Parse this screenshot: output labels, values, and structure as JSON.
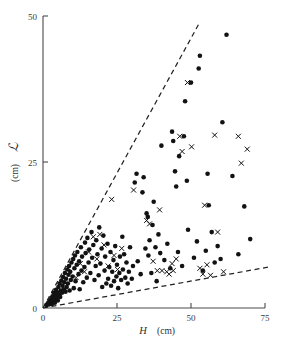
{
  "figure": {
    "background_color": "#ffffff",
    "marker_color": "#121212",
    "axis_color": "#4a4a4a"
  },
  "chart_data": {
    "type": "scatter",
    "title": "",
    "xlabel": "H  (cm)",
    "xlabel_symbol": "H",
    "xlabel_unit": "(cm)",
    "ylabel": "L  (cm)",
    "ylabel_symbol": "L",
    "ylabel_unit": "(cm)",
    "xlim": [
      0,
      75
    ],
    "ylim": [
      0,
      50
    ],
    "xticks": [
      0,
      25,
      50,
      75
    ],
    "xticklabels": [
      "0",
      "25",
      "50",
      "75"
    ],
    "yticks": [
      0,
      25,
      50
    ],
    "yticklabels": [
      "0",
      "25",
      "50"
    ],
    "grid": false,
    "legend": "none",
    "annotations": [
      {
        "name": "upper-dashed-guide",
        "type": "dashed-line",
        "x": [
          0,
          52.5
        ],
        "y": [
          0,
          48.5
        ]
      },
      {
        "name": "lower-dashed-guide",
        "type": "dashed-line",
        "x": [
          0,
          76
        ],
        "y": [
          0,
          7.0
        ]
      }
    ],
    "series": [
      {
        "name": "filled-circle",
        "marker": "o",
        "color": "#121212",
        "points": [
          [
            1.2,
            0.5
          ],
          [
            1.6,
            0.8
          ],
          [
            2.0,
            0.6
          ],
          [
            2.2,
            1.2
          ],
          [
            2.5,
            0.9
          ],
          [
            2.8,
            1.6
          ],
          [
            3.0,
            0.7
          ],
          [
            3.2,
            2.0
          ],
          [
            3.4,
            1.1
          ],
          [
            3.6,
            2.6
          ],
          [
            3.8,
            1.5
          ],
          [
            4.0,
            0.9
          ],
          [
            4.2,
            2.2
          ],
          [
            4.4,
            3.1
          ],
          [
            4.6,
            1.8
          ],
          [
            4.8,
            2.7
          ],
          [
            5.0,
            1.3
          ],
          [
            5.2,
            3.6
          ],
          [
            5.4,
            2.3
          ],
          [
            5.6,
            4.2
          ],
          [
            5.8,
            1.9
          ],
          [
            6.0,
            3.0
          ],
          [
            6.2,
            4.7
          ],
          [
            6.4,
            2.6
          ],
          [
            6.6,
            3.8
          ],
          [
            6.8,
            5.3
          ],
          [
            7.0,
            3.2
          ],
          [
            7.2,
            4.4
          ],
          [
            7.4,
            6.0
          ],
          [
            7.6,
            2.8
          ],
          [
            7.8,
            5.0
          ],
          [
            8.0,
            3.6
          ],
          [
            8.2,
            6.6
          ],
          [
            8.4,
            4.2
          ],
          [
            8.6,
            5.7
          ],
          [
            8.8,
            7.2
          ],
          [
            9.0,
            3.0
          ],
          [
            9.2,
            6.2
          ],
          [
            9.4,
            4.8
          ],
          [
            9.6,
            7.8
          ],
          [
            10.0,
            5.4
          ],
          [
            10.2,
            8.4
          ],
          [
            10.4,
            3.4
          ],
          [
            10.6,
            6.8
          ],
          [
            10.8,
            9.0
          ],
          [
            11.0,
            4.6
          ],
          [
            11.4,
            7.4
          ],
          [
            11.6,
            9.6
          ],
          [
            12.0,
            5.8
          ],
          [
            12.2,
            8.0
          ],
          [
            12.4,
            3.2
          ],
          [
            12.8,
            10.4
          ],
          [
            13.0,
            6.4
          ],
          [
            13.2,
            8.8
          ],
          [
            13.6,
            4.4
          ],
          [
            14.0,
            7.0
          ],
          [
            14.2,
            11.2
          ],
          [
            14.4,
            9.4
          ],
          [
            14.8,
            5.2
          ],
          [
            15.0,
            12.0
          ],
          [
            15.4,
            7.8
          ],
          [
            15.6,
            10.0
          ],
          [
            16.0,
            6.0
          ],
          [
            16.4,
            13.0
          ],
          [
            16.6,
            8.6
          ],
          [
            17.0,
            10.8
          ],
          [
            17.4,
            4.8
          ],
          [
            17.8,
            7.2
          ],
          [
            18.0,
            11.6
          ],
          [
            18.4,
            9.2
          ],
          [
            18.8,
            5.6
          ],
          [
            19.0,
            13.8
          ],
          [
            19.4,
            7.6
          ],
          [
            19.8,
            10.2
          ],
          [
            20.0,
            3.6
          ],
          [
            20.4,
            12.4
          ],
          [
            20.8,
            6.4
          ],
          [
            21.0,
            8.8
          ],
          [
            21.4,
            4.2
          ],
          [
            21.8,
            11.0
          ],
          [
            22.0,
            5.0
          ],
          [
            22.4,
            7.0
          ],
          [
            22.8,
            9.6
          ],
          [
            23.0,
            3.8
          ],
          [
            23.4,
            6.2
          ],
          [
            23.8,
            8.2
          ],
          [
            24.0,
            4.6
          ],
          [
            24.4,
            10.6
          ],
          [
            24.8,
            5.4
          ],
          [
            25.0,
            7.4
          ],
          [
            25.4,
            3.4
          ],
          [
            25.8,
            6.0
          ],
          [
            26.0,
            8.8
          ],
          [
            26.4,
            4.8
          ],
          [
            26.8,
            12.2
          ],
          [
            27.0,
            6.6
          ],
          [
            27.4,
            9.2
          ],
          [
            27.8,
            5.2
          ],
          [
            28.2,
            7.8
          ],
          [
            28.6,
            4.2
          ],
          [
            29.0,
            6.2
          ],
          [
            29.4,
            10.4
          ],
          [
            30.0,
            5.0
          ],
          [
            30.4,
            7.2
          ],
          [
            31.0,
            21.5
          ],
          [
            31.6,
            23.0
          ],
          [
            32.0,
            8.0
          ],
          [
            33.0,
            5.8
          ],
          [
            33.6,
            19.8
          ],
          [
            34.0,
            22.4
          ],
          [
            34.6,
            10.2
          ],
          [
            35.0,
            16.2
          ],
          [
            35.4,
            15.6
          ],
          [
            35.6,
            9.0
          ],
          [
            36.0,
            11.6
          ],
          [
            36.6,
            6.0
          ],
          [
            37.0,
            14.2
          ],
          [
            37.4,
            18.2
          ],
          [
            38.0,
            10.4
          ],
          [
            38.4,
            4.6
          ],
          [
            39.0,
            12.6
          ],
          [
            39.6,
            9.4
          ],
          [
            40.0,
            27.8
          ],
          [
            41.0,
            8.2
          ],
          [
            42.0,
            11.0
          ],
          [
            43.0,
            6.8
          ],
          [
            43.6,
            30.2
          ],
          [
            44.0,
            28.6
          ],
          [
            44.6,
            23.4
          ],
          [
            45.0,
            20.8
          ],
          [
            45.6,
            9.6
          ],
          [
            46.0,
            26.0
          ],
          [
            47.0,
            7.2
          ],
          [
            47.6,
            29.4
          ],
          [
            48.0,
            35.4
          ],
          [
            48.6,
            21.8
          ],
          [
            49.0,
            13.4
          ],
          [
            50.0,
            38.6
          ],
          [
            51.0,
            8.6
          ],
          [
            52.0,
            11.4
          ],
          [
            52.6,
            41.0
          ],
          [
            53.0,
            43.2
          ],
          [
            54.0,
            6.4
          ],
          [
            55.0,
            9.8
          ],
          [
            55.6,
            23.0
          ],
          [
            56.0,
            17.6
          ],
          [
            57.0,
            13.0
          ],
          [
            58.0,
            7.8
          ],
          [
            59.0,
            10.6
          ],
          [
            60.0,
            8.4
          ],
          [
            60.6,
            31.8
          ],
          [
            62.0,
            46.8
          ],
          [
            64.0,
            22.6
          ],
          [
            66.0,
            9.2
          ],
          [
            68.0,
            17.4
          ],
          [
            70.0,
            11.8
          ]
        ]
      },
      {
        "name": "cross",
        "marker": "x",
        "color": "#121212",
        "points": [
          [
            8.6,
            6.8
          ],
          [
            11.2,
            5.2
          ],
          [
            12.6,
            7.6
          ],
          [
            14.0,
            6.2
          ],
          [
            15.4,
            9.6
          ],
          [
            17.0,
            12.2
          ],
          [
            18.2,
            8.4
          ],
          [
            19.2,
            12.6
          ],
          [
            20.6,
            10.8
          ],
          [
            22.0,
            7.2
          ],
          [
            23.2,
            18.6
          ],
          [
            24.0,
            9.0
          ],
          [
            25.2,
            6.6
          ],
          [
            26.6,
            10.2
          ],
          [
            30.6,
            20.2
          ],
          [
            35.0,
            15.0
          ],
          [
            36.0,
            14.4
          ],
          [
            37.2,
            8.0
          ],
          [
            38.6,
            6.4
          ],
          [
            39.4,
            16.8
          ],
          [
            40.2,
            6.4
          ],
          [
            41.8,
            6.2
          ],
          [
            42.6,
            5.8
          ],
          [
            43.6,
            7.6
          ],
          [
            44.0,
            6.4
          ],
          [
            45.0,
            8.4
          ],
          [
            46.2,
            29.4
          ],
          [
            47.0,
            26.8
          ],
          [
            48.8,
            38.6
          ],
          [
            50.2,
            27.6
          ],
          [
            53.0,
            6.8
          ],
          [
            54.0,
            5.8
          ],
          [
            54.6,
            17.6
          ],
          [
            55.4,
            7.4
          ],
          [
            56.6,
            5.6
          ],
          [
            58.0,
            29.6
          ],
          [
            59.0,
            13.0
          ],
          [
            61.0,
            6.2
          ],
          [
            66.0,
            29.4
          ],
          [
            67.0,
            24.8
          ],
          [
            69.0,
            27.2
          ]
        ]
      }
    ]
  }
}
